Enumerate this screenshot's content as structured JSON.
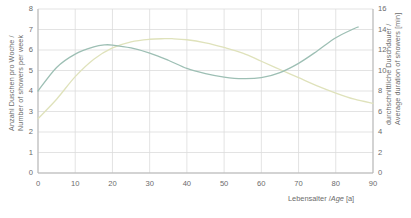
{
  "chart_data": {
    "type": "line",
    "title": "",
    "xlabel": "Lebensalter / Age [a]",
    "ylabel_left": "Anzahl Duschen pro Woche / Number of showers per week",
    "ylabel_left_line1": "Anzahl Duschen pro Woche /",
    "ylabel_left_line2": "Number of showers per week",
    "ylabel_right": "durchschnittliche Duschdauer / Average duration of showers [min]",
    "ylabel_right_line1": "durchschnittliche Duschdauer /",
    "ylabel_right_line2": "Average duration of showers [min]",
    "xlim": [
      0,
      90
    ],
    "ylim_left": [
      0,
      8
    ],
    "ylim_right": [
      0,
      16
    ],
    "xticks": [
      0,
      10,
      20,
      30,
      40,
      50,
      60,
      70,
      80,
      90
    ],
    "yticks_left": [
      0,
      1,
      2,
      3,
      4,
      5,
      6,
      7,
      8
    ],
    "yticks_right": [
      0,
      2,
      4,
      6,
      8,
      10,
      12,
      14,
      16
    ],
    "grid": true,
    "legend": "none",
    "series": [
      {
        "name": "Anzahl Duschen pro Woche / Number of showers per week",
        "axis": "left",
        "color": "#9dbfb4",
        "x": [
          0,
          5,
          10,
          15,
          18,
          20,
          25,
          30,
          35,
          40,
          45,
          50,
          55,
          60,
          65,
          70,
          75,
          80,
          85,
          86
        ],
        "values": [
          4.0,
          5.15,
          5.8,
          6.15,
          6.25,
          6.24,
          6.1,
          5.85,
          5.5,
          5.1,
          4.85,
          4.68,
          4.6,
          4.65,
          4.9,
          5.35,
          5.95,
          6.6,
          7.05,
          7.12
        ]
      },
      {
        "name": "durchschnittliche Duschdauer / Average duration of showers [min]",
        "axis": "right",
        "color": "#dfe2bb",
        "x": [
          0,
          5,
          10,
          15,
          20,
          25,
          30,
          34,
          36,
          40,
          45,
          50,
          55,
          60,
          65,
          70,
          75,
          80,
          85,
          90
        ],
        "values": [
          5.3,
          7.2,
          9.4,
          11.1,
          12.2,
          12.8,
          13.05,
          13.1,
          13.1,
          13.0,
          12.7,
          12.25,
          11.7,
          10.9,
          10.1,
          9.3,
          8.5,
          7.8,
          7.2,
          6.8
        ]
      }
    ],
    "series_left_display": {
      "note": "teal curve plotted against left axis (showers/week)"
    },
    "series_right_display": {
      "note": "yellow curve plotted against right axis (minutes)"
    }
  },
  "tick_text": {
    "y_left": [
      "8",
      "7",
      "6",
      "5",
      "4",
      "3",
      "2",
      "1",
      "0"
    ],
    "y_right": [
      "16",
      "14",
      "12",
      "10",
      "8",
      "6",
      "4",
      "2",
      "0"
    ],
    "x": [
      "0",
      "10",
      "20",
      "30",
      "40",
      "50",
      "60",
      "70",
      "80",
      "90"
    ]
  },
  "colors": {
    "grid": "#dcdcdc",
    "axis": "#b5b5b5",
    "text": "#6b6b6b",
    "series_showers": "#9dbfb4",
    "series_duration": "#dfe2bb",
    "background": "#ffffff"
  },
  "x_axis_label_parts": {
    "pre": "Lebensalter /",
    "italic": "Age",
    "post": " [a]"
  }
}
